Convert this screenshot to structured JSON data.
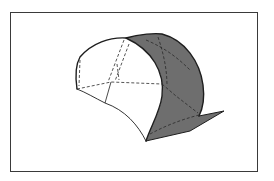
{
  "figure": {
    "colors": {
      "frame": "#3a3a3a",
      "outline": "#1e1e1e",
      "shaded_face": "#6e6e6e",
      "inner_face": "#ffffff",
      "dashed_lines": "#2a2a2a"
    }
  }
}
